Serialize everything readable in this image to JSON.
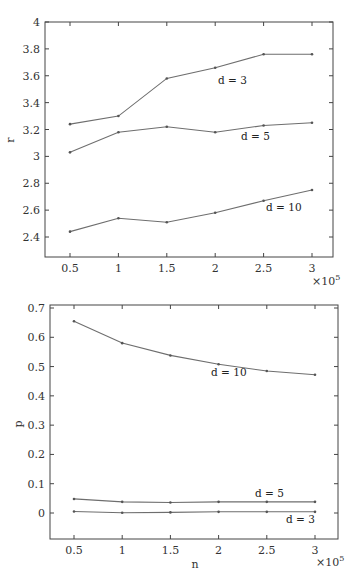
{
  "chart_data": [
    {
      "type": "line",
      "title": "",
      "xlabel": "",
      "ylabel": "r",
      "x_multiplier_label": "×10^5",
      "x": [
        0.5,
        1,
        1.5,
        2,
        2.5,
        3
      ],
      "xticks": [
        "0.5",
        "1",
        "1.5",
        "2",
        "2.5",
        "3"
      ],
      "yticks": [
        "2.4",
        "2.6",
        "2.8",
        "3",
        "3.2",
        "3.4",
        "3.6",
        "3.8",
        "4"
      ],
      "xlim": [
        0.25,
        3.25
      ],
      "ylim": [
        2.25,
        4.0
      ],
      "grid": false,
      "legend": "inline labels",
      "series": [
        {
          "name": "d = 3",
          "values": [
            3.24,
            3.3,
            3.58,
            3.66,
            3.76,
            3.76
          ]
        },
        {
          "name": "d = 5",
          "values": [
            3.03,
            3.18,
            3.22,
            3.18,
            3.23,
            3.25
          ]
        },
        {
          "name": "d = 10",
          "values": [
            2.44,
            2.54,
            2.51,
            2.58,
            2.67,
            2.75
          ]
        }
      ]
    },
    {
      "type": "line",
      "title": "",
      "xlabel": "n",
      "ylabel": "p",
      "x_multiplier_label": "×10^5",
      "x": [
        0.5,
        1,
        1.5,
        2,
        2.5,
        3
      ],
      "xticks": [
        "0.5",
        "1",
        "1.5",
        "2",
        "2.5",
        "3"
      ],
      "yticks": [
        "0",
        "0.1",
        "0.2",
        "0.3",
        "0.4",
        "0.5",
        "0.6",
        "0.7"
      ],
      "xlim": [
        0.25,
        3.25
      ],
      "ylim": [
        -0.09,
        0.71
      ],
      "grid": false,
      "legend": "inline labels",
      "series": [
        {
          "name": "d = 10",
          "values": [
            0.655,
            0.58,
            0.538,
            0.508,
            0.485,
            0.472
          ]
        },
        {
          "name": "d = 5",
          "values": [
            0.048,
            0.038,
            0.036,
            0.038,
            0.038,
            0.038
          ]
        },
        {
          "name": "d = 3",
          "values": [
            0.005,
            0.001,
            0.002,
            0.004,
            0.004,
            0.004
          ]
        }
      ]
    }
  ],
  "top_chart": {
    "ylabel": "r",
    "multiplier": "×10",
    "multiplier_exp": "5",
    "xticks": [
      "0.5",
      "1",
      "1.5",
      "2",
      "2.5",
      "3"
    ],
    "yticks": [
      "2.4",
      "2.6",
      "2.8",
      "3",
      "3.2",
      "3.4",
      "3.6",
      "3.8",
      "4"
    ],
    "labels": {
      "d3": "d = 3",
      "d5": "d = 5",
      "d10": "d = 10"
    }
  },
  "bottom_chart": {
    "ylabel": "p",
    "xlabel": "n",
    "multiplier": "×10",
    "multiplier_exp": "5",
    "xticks": [
      "0.5",
      "1",
      "1.5",
      "2",
      "2.5",
      "3"
    ],
    "yticks": [
      "0",
      "0.1",
      "0.2",
      "0.3",
      "0.4",
      "0.5",
      "0.6",
      "0.7"
    ],
    "labels": {
      "d10": "d = 10",
      "d5": "d = 5",
      "d3": "d = 3"
    }
  },
  "colors": {
    "line": "#6e6e6e",
    "axis": "#444444",
    "marker": "#555555"
  }
}
